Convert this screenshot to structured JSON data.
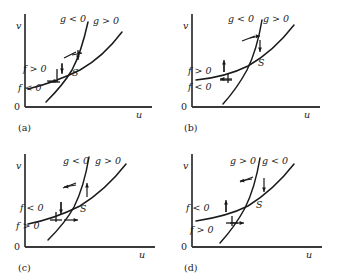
{
  "figure": {
    "type": "phase-plane-nullcline-diagram",
    "panel_count": 4,
    "axis_labels": {
      "x": "u",
      "y": "v",
      "origin": "0"
    },
    "equilibrium_label": "S",
    "curves": [
      "f = 0 nullcline",
      "g = 0 nullcline"
    ]
  },
  "panels": [
    {
      "tag": "(a)",
      "axis_x": "u",
      "axis_y": "v",
      "origin": "0",
      "equilibrium": "S",
      "g_left": "g < 0",
      "g_right": "g > 0",
      "f_upper": "f > 0",
      "f_lower": "f < 0",
      "arrows": {
        "g_left_horizontal": "right",
        "g_right_horizontal": "left",
        "f_upper_vertical": "down",
        "f_lower_vertical": "down"
      }
    },
    {
      "tag": "(b)",
      "axis_x": "u",
      "axis_y": "v",
      "origin": "0",
      "equilibrium": "S",
      "g_left": "g < 0",
      "g_right": "g > 0",
      "f_upper": "f > 0",
      "f_lower": "f < 0",
      "arrows": {
        "g_left_horizontal": "right",
        "g_right_horizontal": "left",
        "f_upper_vertical": "up",
        "f_lower_vertical": "down"
      }
    },
    {
      "tag": "(c)",
      "axis_x": "u",
      "axis_y": "v",
      "origin": "0",
      "equilibrium": "S",
      "g_left": "g < 0",
      "g_right": "g > 0",
      "f_upper": "f < 0",
      "f_lower": "f > 0",
      "arrows": {
        "g_left_horizontal": "left",
        "g_right_horizontal": "right",
        "f_upper_vertical": "down",
        "f_lower_vertical": "up"
      }
    },
    {
      "tag": "(d)",
      "axis_x": "u",
      "axis_y": "v",
      "origin": "0",
      "equilibrium": "S",
      "g_left": "g > 0",
      "g_right": "g < 0",
      "f_upper": "f < 0",
      "f_lower": "f > 0",
      "arrows": {
        "g_left_horizontal": "left",
        "g_right_horizontal": "down",
        "f_upper_vertical": "up",
        "f_lower_vertical": "up"
      }
    }
  ],
  "colors": {
    "ink": "#1a1a1a",
    "axis": "#3a3a3a",
    "background": "#ffffff"
  }
}
